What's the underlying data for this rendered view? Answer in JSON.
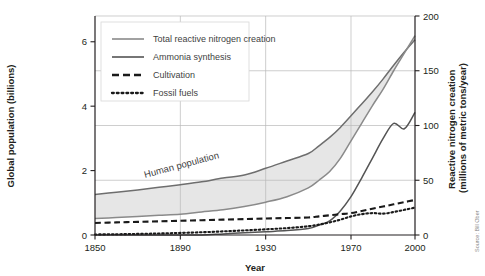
{
  "figure": {
    "source_credit": "Source: Bill Ober"
  },
  "chart_data": {
    "type": "line",
    "title": "",
    "xlabel": "Year",
    "ylabel": "Global population (billions)",
    "y2label": "Reactive nitrogen creation (millions of metric tons/year)",
    "xlim": [
      1850,
      2000
    ],
    "ylim": [
      0,
      6.8
    ],
    "y2lim": [
      0,
      200
    ],
    "grid": true,
    "legend_position": "top-left",
    "xticks": [
      1850,
      1890,
      1930,
      1970,
      2000
    ],
    "xtick_labels": [
      "1850",
      "1890",
      "1930",
      "1970",
      "2000"
    ],
    "yticks": [
      0,
      2,
      4,
      6
    ],
    "ytick_labels": [
      "0",
      "2",
      "4",
      "6"
    ],
    "y2ticks": [
      0,
      50,
      100,
      150,
      200
    ],
    "y2tick_labels": [
      "0",
      "50",
      "100",
      "150",
      "200"
    ],
    "annotations": [
      {
        "text": "Human population",
        "x": 1905,
        "y": 1.75
      }
    ],
    "legend": [
      {
        "label": "Total reactive nitrogen creation",
        "style": "solid",
        "color": "#8a8a8a"
      },
      {
        "label": "Ammonia synthesis",
        "style": "solid",
        "color": "#545454"
      },
      {
        "label": "Cultivation",
        "style": "dashed",
        "color": "#1a1a1a"
      },
      {
        "label": "Fossil fuels",
        "style": "dotted",
        "color": "#1a1a1a"
      }
    ],
    "x": [
      1850,
      1860,
      1870,
      1880,
      1890,
      1900,
      1910,
      1920,
      1930,
      1940,
      1950,
      1955,
      1960,
      1965,
      1970,
      1975,
      1980,
      1985,
      1990,
      1995,
      2000
    ],
    "series": [
      {
        "name": "Human population",
        "axis": "left",
        "units": "billions",
        "style": "solid",
        "color": "#6e6e6e",
        "values": [
          1.26,
          1.33,
          1.4,
          1.48,
          1.56,
          1.65,
          1.77,
          1.86,
          2.07,
          2.3,
          2.53,
          2.77,
          3.03,
          3.34,
          3.7,
          4.07,
          4.44,
          4.84,
          5.27,
          5.68,
          6.06
        ]
      },
      {
        "name": "Total reactive nitrogen creation",
        "axis": "right",
        "units": "millions of metric tons/year",
        "style": "solid",
        "color": "#8a8a8a",
        "values": [
          15,
          16,
          17,
          18,
          19,
          21,
          23,
          26,
          30,
          35,
          43,
          50,
          58,
          70,
          86,
          102,
          118,
          133,
          150,
          166,
          182
        ]
      },
      {
        "name": "Ammonia synthesis",
        "axis": "right",
        "units": "millions of metric tons/year",
        "style": "solid",
        "color": "#545454",
        "values": [
          0,
          0,
          0,
          0,
          0,
          0,
          1,
          2,
          3,
          4,
          6,
          9,
          13,
          22,
          35,
          52,
          70,
          88,
          102,
          97,
          112
        ]
      },
      {
        "name": "Cultivation",
        "axis": "right",
        "units": "millions of metric tons/year",
        "style": "dashed",
        "color": "#1a1a1a",
        "values": [
          11,
          11.5,
          12,
          12.5,
          13,
          13.5,
          14,
          14.5,
          15,
          15.5,
          16,
          17,
          18,
          19,
          20,
          22,
          24,
          26,
          28,
          30,
          32
        ]
      },
      {
        "name": "Fossil fuels",
        "axis": "right",
        "units": "millions of metric tons/year",
        "style": "dotted",
        "color": "#1a1a1a",
        "values": [
          0.5,
          0.7,
          1,
          1.4,
          1.9,
          2.5,
          3.3,
          4.2,
          5.2,
          6.3,
          8,
          9.5,
          11.5,
          14,
          17,
          19,
          20,
          19.5,
          21,
          23,
          25
        ]
      }
    ],
    "band": {
      "name": "population-shaded-band",
      "upper_series": "Human population",
      "lower_series": "Total reactive nitrogen creation",
      "fill": "#e6e6e6"
    }
  }
}
